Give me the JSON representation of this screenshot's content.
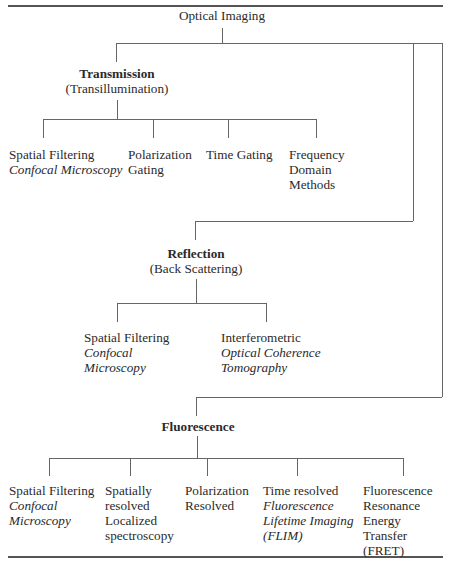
{
  "diagram": {
    "root": {
      "label": "Optical Imaging"
    },
    "branches": [
      {
        "title": "Transmission",
        "subtitle": "(Transillumination)",
        "children": [
          {
            "lines": [
              "Spatial Filtering"
            ],
            "italic_lines": [
              "Confocal Microscopy"
            ]
          },
          {
            "lines": [
              "Polarization",
              "Gating"
            ],
            "italic_lines": []
          },
          {
            "lines": [
              "Time Gating"
            ],
            "italic_lines": []
          },
          {
            "lines": [
              "Frequency",
              "Domain",
              "Methods"
            ],
            "italic_lines": []
          }
        ]
      },
      {
        "title": "Reflection",
        "subtitle": "(Back Scattering)",
        "children": [
          {
            "lines": [
              "Spatial Filtering"
            ],
            "italic_lines": [
              "Confocal",
              "Microscopy"
            ]
          },
          {
            "lines": [
              "Interferometric"
            ],
            "italic_lines": [
              "Optical Coherence",
              "Tomography"
            ]
          }
        ]
      },
      {
        "title": "Fluorescence",
        "subtitle": "",
        "children": [
          {
            "lines": [
              "Spatial Filtering"
            ],
            "italic_lines": [
              "Confocal",
              "Microscopy"
            ]
          },
          {
            "lines": [
              "Spatially",
              "resolved",
              "Localized",
              "spectroscopy"
            ],
            "italic_lines": []
          },
          {
            "lines": [
              "Polarization",
              "Resolved"
            ],
            "italic_lines": []
          },
          {
            "lines": [
              "Time resolved"
            ],
            "italic_lines": [
              "Fluorescence",
              "Lifetime Imaging",
              "(FLIM)"
            ]
          },
          {
            "lines": [
              "Fluorescence",
              "Resonance",
              "Energy",
              "Transfer",
              "(FRET)"
            ],
            "italic_lines": []
          }
        ]
      }
    ]
  },
  "colors": {
    "text": "#2a2a2a",
    "lines": "#666666",
    "background": "#ffffff"
  }
}
